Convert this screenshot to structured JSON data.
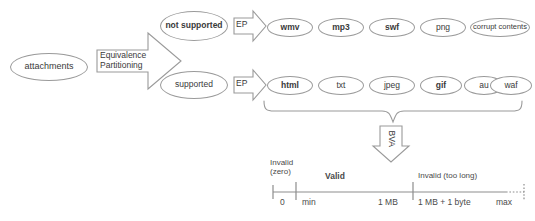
{
  "diagram": {
    "colors": {
      "stroke": "#9a9a9a",
      "axis_stroke": "#8d8d8d",
      "text": "#3a3a3a",
      "background": "#ffffff"
    },
    "source_node": {
      "label": "attachments",
      "bold": false
    },
    "main_arrow": {
      "label": "Equivalence\nPartitioning",
      "direction": "right"
    },
    "branches": [
      {
        "id": "not-supported",
        "label": "not\nsupported",
        "bold": true,
        "arrow_label": "EP",
        "arrow_direction": "right",
        "leaves": [
          {
            "label": "wmv",
            "bold": true
          },
          {
            "label": "mp3",
            "bold": true
          },
          {
            "label": "swf",
            "bold": true
          },
          {
            "label": "png",
            "bold": false
          },
          {
            "label": "corrupt contents",
            "bold": false
          }
        ]
      },
      {
        "id": "supported",
        "label": "supported",
        "bold": false,
        "arrow_label": "EP",
        "arrow_direction": "right",
        "leaves": [
          {
            "label": "html",
            "bold": true
          },
          {
            "label": "txt",
            "bold": false
          },
          {
            "label": "jpeg",
            "bold": false
          },
          {
            "label": "gif",
            "bold": true
          },
          {
            "label": "au",
            "bold": false
          },
          {
            "label": "waf",
            "bold": false
          }
        ]
      }
    ],
    "bva_arrow": {
      "label": "BVA",
      "direction": "down",
      "rotated": true
    },
    "number_line": {
      "partitions": [
        {
          "label": "Invalid\n(zero)",
          "bold": false
        },
        {
          "label": "Valid",
          "bold": true
        },
        {
          "label": "Invalid (too long)",
          "bold": false
        }
      ],
      "ticks": [
        {
          "label": "0",
          "bold": false
        },
        {
          "label": "min",
          "bold": false
        },
        {
          "label": "1 MB",
          "bold": false
        },
        {
          "label": "1 MB + 1 byte",
          "bold": false
        },
        {
          "label": "max",
          "bold": false
        }
      ]
    }
  }
}
